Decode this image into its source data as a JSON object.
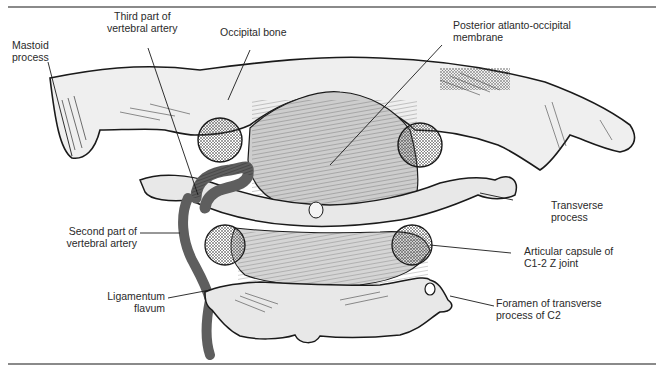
{
  "figure": {
    "colors": {
      "bone": "#e6e6e6",
      "outline": "#1a1a1a",
      "membrane": "#cfcfcf",
      "artery": "#6e6e6e",
      "rule": "#8a8a8a",
      "label_text": "#2a2a2a"
    },
    "labels": [
      {
        "id": "mastoid-process",
        "lines": [
          "Mastoid",
          "process"
        ]
      },
      {
        "id": "third-part-vertebral-artery",
        "lines": [
          "Third part of",
          "vertebral artery"
        ]
      },
      {
        "id": "occipital-bone",
        "lines": [
          "Occipital bone"
        ]
      },
      {
        "id": "posterior-atlanto-occipital-membrane",
        "lines": [
          "Posterior atlanto-occipital",
          "membrane"
        ]
      },
      {
        "id": "transverse-process",
        "lines": [
          "Transverse",
          "process"
        ]
      },
      {
        "id": "second-part-vertebral-artery",
        "lines": [
          "Second part of",
          "vertebral artery"
        ]
      },
      {
        "id": "articular-capsule",
        "lines": [
          "Articular capsule of",
          "C1-2 Z joint"
        ]
      },
      {
        "id": "ligamentum-flavum",
        "lines": [
          "Ligamentum",
          "flavum"
        ]
      },
      {
        "id": "foramen-transverse-process",
        "lines": [
          "Foramen of transverse",
          "process of C2"
        ]
      }
    ]
  }
}
